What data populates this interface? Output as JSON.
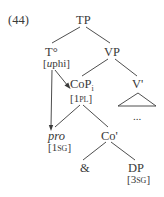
{
  "example_number": "(44)",
  "nodes": {
    "tp": {
      "label": "TP"
    },
    "t": {
      "label": "T°",
      "feature_open": "[",
      "feature_u": "u",
      "feature_rest": "phi]"
    },
    "vp": {
      "label": "VP"
    },
    "cop": {
      "label": "CoP",
      "index": "i",
      "feature": "[1PL]",
      "feature_num": "[1",
      "feature_sc": "pl",
      "feature_close": "]"
    },
    "vbar": {
      "label": "V'"
    },
    "ellipsis": {
      "label": "..."
    },
    "pro": {
      "label": "pro",
      "feature_num": "[1",
      "feature_sc": "sg",
      "feature_close": "]"
    },
    "cobar": {
      "label": "Co'"
    },
    "amp": {
      "label": "&"
    },
    "dp": {
      "label": "DP",
      "feature_num": "[3",
      "feature_sc": "sg",
      "feature_close": "]"
    }
  },
  "colors": {
    "line": "#3a3a3a",
    "text": "#3a3a3a",
    "background": "#ffffff"
  }
}
